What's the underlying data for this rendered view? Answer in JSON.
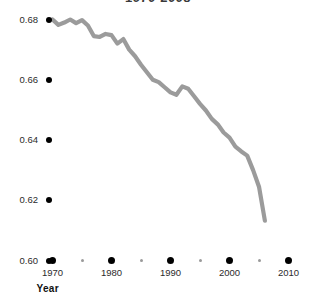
{
  "chart_data": {
    "type": "line",
    "title": "1970-2008",
    "xlabel": "Year",
    "ylabel": "Gini ratio",
    "xlim": [
      1969,
      2011
    ],
    "ylim": [
      0.5985,
      0.6855
    ],
    "grid": false,
    "legend": null,
    "line_color": "#9b9b9b",
    "x_ticks_major": [
      1970,
      1980,
      1990,
      2000,
      2010
    ],
    "x_ticks_major_labels": [
      "1970",
      "1980",
      "1990",
      "2000",
      "2010"
    ],
    "x_ticks_minor": [
      1975,
      1985,
      1995,
      2005
    ],
    "y_ticks": [
      0.6,
      0.62,
      0.64,
      0.66,
      0.68
    ],
    "y_tick_labels": [
      "0.60",
      "0.62",
      "0.64",
      "0.66",
      "0.68"
    ],
    "series": [
      {
        "name": "Gini ratio",
        "x": [
          1970,
          1971,
          1972,
          1973,
          1974,
          1975,
          1976,
          1977,
          1978,
          1979,
          1980,
          1981,
          1982,
          1983,
          1984,
          1985,
          1986,
          1987,
          1988,
          1989,
          1990,
          1991,
          1992,
          1993,
          1994,
          1995,
          1996,
          1997,
          1998,
          1999,
          2000,
          2001,
          2002,
          2003,
          2004,
          2005,
          2006
        ],
        "y": [
          0.68,
          0.6782,
          0.679,
          0.68,
          0.6788,
          0.6798,
          0.678,
          0.6745,
          0.6742,
          0.6752,
          0.6748,
          0.672,
          0.6735,
          0.67,
          0.6678,
          0.665,
          0.6625,
          0.66,
          0.6592,
          0.6575,
          0.6558,
          0.655,
          0.6578,
          0.657,
          0.6545,
          0.652,
          0.6498,
          0.647,
          0.6452,
          0.6425,
          0.6408,
          0.6378,
          0.6362,
          0.6348,
          0.63,
          0.6245,
          0.6132
        ]
      }
    ]
  },
  "axes": {
    "y_ticks": [
      {
        "label": "0.68",
        "value": 0.68
      },
      {
        "label": "0.66",
        "value": 0.66
      },
      {
        "label": "0.64",
        "value": 0.64
      },
      {
        "label": "0.62",
        "value": 0.62
      },
      {
        "label": "0.60",
        "value": 0.6
      }
    ],
    "x_ticks": [
      {
        "label": "1970",
        "value": 1970
      },
      {
        "label": "1980",
        "value": 1980
      },
      {
        "label": "1990",
        "value": 1990
      },
      {
        "label": "2000",
        "value": 2000
      },
      {
        "label": "2010",
        "value": 2010
      }
    ],
    "x_title": "Year",
    "y_title": "Gini ratio"
  },
  "title": "1970-2008"
}
